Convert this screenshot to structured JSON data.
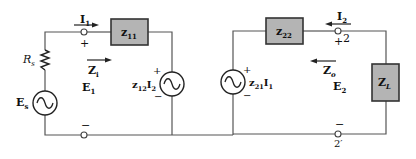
{
  "diagram": {
    "colors": {
      "box_fill": "#b4b4b4",
      "box_stroke": "#333333",
      "wire": "#555555"
    },
    "input_port": {
      "current_label": "I",
      "current_sub": "1",
      "plus": "+",
      "minus": "−",
      "voltage_label": "E",
      "voltage_sub": "1",
      "impedance_label": "Z",
      "impedance_sub": "i"
    },
    "source": {
      "resistor_label": "R",
      "resistor_sub": "s",
      "voltage_label": "E",
      "voltage_sub": "s"
    },
    "z11": {
      "label": "z",
      "sub": "11"
    },
    "z22": {
      "label": "z",
      "sub": "22"
    },
    "dep_source_1": {
      "label": "z",
      "sub": "12",
      "factor": "I",
      "factor_sub": "2",
      "plus": "+",
      "minus": "−"
    },
    "dep_source_2": {
      "label": "z",
      "sub": "21",
      "factor": "I",
      "factor_sub": "1",
      "plus": "+",
      "minus": "−"
    },
    "output_port": {
      "current_label": "I",
      "current_sub": "2",
      "plus": "+",
      "terminal_top": "2",
      "minus": "−",
      "terminal_bottom": "2′",
      "voltage_label": "E",
      "voltage_sub": "2",
      "impedance_label": "Z",
      "impedance_sub": "o"
    },
    "load": {
      "label": "Z",
      "sub": "L"
    }
  }
}
